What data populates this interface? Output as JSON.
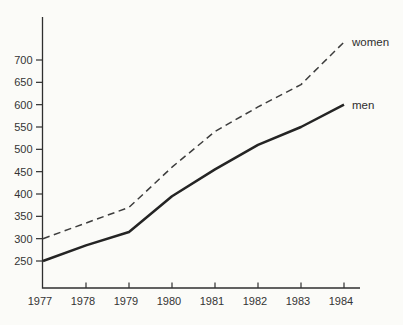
{
  "figure": {
    "background_color": "#fbfbf8",
    "axis_color": "#2f2f2f",
    "text_color": "#343434",
    "men_line_color": "#242424",
    "women_line_color": "#3d3d3d"
  },
  "chart_data": {
    "type": "line",
    "title": "",
    "xlabel": "",
    "ylabel": "",
    "categories": [
      "1977",
      "1978",
      "1979",
      "1980",
      "1981",
      "1982",
      "1983",
      "1984"
    ],
    "y_ticks": [
      250,
      300,
      350,
      400,
      450,
      500,
      550,
      600,
      650,
      700
    ],
    "ylim": [
      190,
      795
    ],
    "grid": false,
    "legend_position": "line-end-labels",
    "series": [
      {
        "name": "women",
        "style": "dashed",
        "values": [
          300,
          335,
          370,
          460,
          540,
          595,
          645,
          740
        ]
      },
      {
        "name": "men",
        "style": "solid",
        "values": [
          250,
          285,
          315,
          395,
          455,
          510,
          550,
          600
        ]
      }
    ]
  }
}
